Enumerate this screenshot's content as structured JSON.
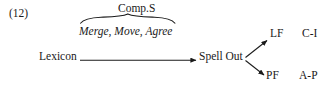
{
  "figure": {
    "example_number": "(12)",
    "background_color": "#ffffff",
    "ink_color": "#1a1a1a"
  },
  "nodes": {
    "lexicon": "Lexicon",
    "spell_out": "Spell Out",
    "lf": "LF",
    "pf": "PF",
    "ci": "C-I",
    "ap": "A-P"
  },
  "annotations": {
    "brace_top_label": "Comp.S",
    "brace_bottom_label": "Merge, Move, Agree"
  },
  "arrows": [
    {
      "from": "Lexicon",
      "to": "Spell Out",
      "direction": "right"
    },
    {
      "from": "Spell Out",
      "to": "LF",
      "direction": "up-right"
    },
    {
      "from": "Spell Out",
      "to": "PF",
      "direction": "down-right"
    }
  ]
}
